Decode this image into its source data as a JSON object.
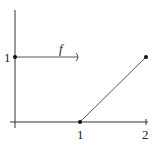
{
  "diagram": {
    "type": "piecewise-function-plot",
    "function_label": "f",
    "x_ticks": [
      "1",
      "2"
    ],
    "y_ticks": [
      "1"
    ],
    "segments": [
      {
        "name": "constant-segment",
        "from": [
          0,
          1
        ],
        "to": [
          1,
          1
        ],
        "start": "closed",
        "end": "open"
      },
      {
        "name": "linear-segment",
        "from": [
          1,
          0
        ],
        "to": [
          2,
          1
        ],
        "start": "closed",
        "end": "closed"
      }
    ],
    "colors": {
      "axis": "#333333",
      "line": "#555555",
      "point": "#111111"
    }
  }
}
